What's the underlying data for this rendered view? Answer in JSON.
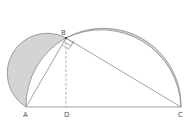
{
  "diagram": {
    "title": "",
    "points": {
      "A": {
        "label": "A",
        "x": 26,
        "y": 107
      },
      "B": {
        "label": "B",
        "x": 66,
        "y": 38
      },
      "C": {
        "label": "C",
        "x": 181,
        "y": 107
      },
      "D": {
        "label": "D",
        "x": 66,
        "y": 107
      }
    },
    "colors": {
      "shade": "#d4d4d4",
      "line": "#8a8a8a",
      "dashed": "#8a8a8a"
    },
    "labels": {
      "A": "A",
      "B": "B",
      "C": "C",
      "D": "D"
    }
  }
}
